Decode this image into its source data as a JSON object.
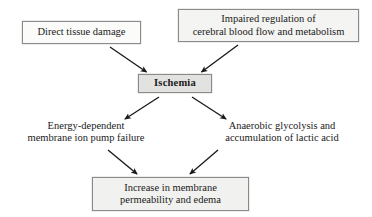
{
  "diagram": {
    "type": "flowchart",
    "canvas": {
      "width": 372,
      "height": 217
    },
    "colors": {
      "background": "#ffffff",
      "box_border": "#8a8a8a",
      "box_fill_light": "#fbfbfa",
      "box_fill_gray": "#e2e2e0",
      "text": "#1a1a1a",
      "arrow": "#1a1a1a"
    },
    "nodes": [
      {
        "id": "direct-tissue-damage",
        "label": "Direct tissue damage",
        "boxed": true,
        "bold": false,
        "row": "causes"
      },
      {
        "id": "impaired-regulation",
        "label": "Impaired regulation of\ncerebral blood flow and metabolism",
        "boxed": true,
        "bold": false,
        "row": "causes"
      },
      {
        "id": "ischemia",
        "label": "Ischemia",
        "boxed": true,
        "bold": true,
        "row": "central"
      },
      {
        "id": "energy-dependent",
        "label": "Energy-dependent\nmembrane ion pump failure",
        "boxed": false,
        "bold": false,
        "row": "mechanisms"
      },
      {
        "id": "anaerobic-glycolysis",
        "label": "Anaerobic glycolysis and\naccumulation of lactic acid",
        "boxed": false,
        "bold": false,
        "row": "mechanisms"
      },
      {
        "id": "increase-permeability",
        "label": "Increase in membrane\npermeability and edema",
        "boxed": true,
        "bold": false,
        "row": "outcome"
      }
    ],
    "edges": [
      {
        "id": "edge-direct-to-ischemia",
        "from": "direct-tissue-damage",
        "to": "ischemia",
        "style": "solid-arrow"
      },
      {
        "id": "edge-impaired-to-ischemia",
        "from": "impaired-regulation",
        "to": "ischemia",
        "style": "solid-arrow"
      },
      {
        "id": "edge-ischemia-to-energy",
        "from": "ischemia",
        "to": "energy-dependent",
        "style": "solid-arrow"
      },
      {
        "id": "edge-ischemia-to-anaerobic",
        "from": "ischemia",
        "to": "anaerobic-glycolysis",
        "style": "solid-arrow"
      },
      {
        "id": "edge-energy-to-increase",
        "from": "energy-dependent",
        "to": "increase-permeability",
        "style": "solid-arrow"
      },
      {
        "id": "edge-anaerobic-to-increase",
        "from": "anaerobic-glycolysis",
        "to": "increase-permeability",
        "style": "solid-arrow"
      }
    ]
  }
}
